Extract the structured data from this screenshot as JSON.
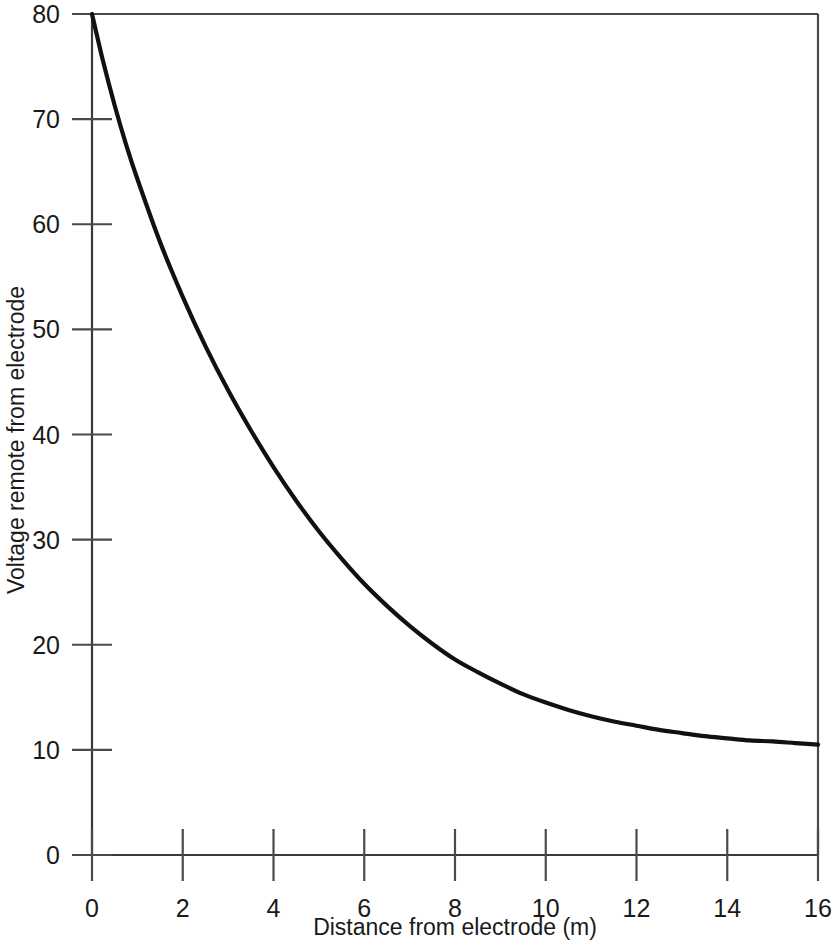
{
  "chart_data": {
    "type": "line",
    "title": "",
    "subtitle": "",
    "xlabel": "Distance from electrode (m)",
    "ylabel": "Voltage remote from electrode",
    "xlim": [
      0,
      16
    ],
    "ylim": [
      0,
      80
    ],
    "xticks": [
      0,
      2,
      4,
      6,
      8,
      10,
      12,
      14,
      16
    ],
    "xtick_labels": [
      "0",
      "2",
      "4",
      "6",
      "8",
      "10",
      "12",
      "14",
      "16"
    ],
    "yticks": [
      0,
      10,
      20,
      30,
      40,
      50,
      60,
      70,
      80
    ],
    "ytick_labels": [
      "0",
      "10",
      "20",
      "30",
      "40",
      "50",
      "60",
      "70",
      "80"
    ],
    "grid": false,
    "legend": null,
    "legend_position": "none",
    "line_color": "#111111",
    "axis_color": "#4a4a4a",
    "background_color": "#ffffff",
    "annotations": [],
    "series": [
      {
        "name": "Voltage remote from electrode",
        "x": [
          0,
          0.25,
          0.5,
          0.75,
          1,
          1.5,
          2,
          2.5,
          3,
          3.5,
          4,
          4.5,
          5,
          5.5,
          6,
          6.5,
          7,
          7.5,
          8,
          8.5,
          9,
          9.5,
          10,
          10.5,
          11,
          11.5,
          12,
          12.5,
          13,
          13.5,
          14,
          14.5,
          15,
          15.5,
          16
        ],
        "y": [
          80.0,
          75.4,
          71.3,
          67.6,
          64.3,
          58.3,
          53.1,
          48.4,
          44.2,
          40.4,
          36.9,
          33.7,
          30.8,
          28.2,
          25.8,
          23.7,
          21.8,
          20.1,
          18.6,
          17.4,
          16.3,
          15.3,
          14.5,
          13.8,
          13.2,
          12.7,
          12.3,
          11.9,
          11.6,
          11.3,
          11.1,
          10.9,
          10.8,
          10.65,
          10.5
        ]
      }
    ]
  },
  "figure": {
    "x_axis_label": "Distance from electrode (m)",
    "y_axis_label": "Voltage remote from electrode"
  }
}
